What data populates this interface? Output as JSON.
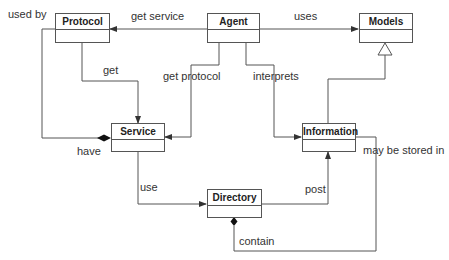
{
  "diagram": {
    "type": "UML class diagram",
    "classes": [
      {
        "id": "protocol",
        "name": "Protocol"
      },
      {
        "id": "agent",
        "name": "Agent"
      },
      {
        "id": "models",
        "name": "Models"
      },
      {
        "id": "service",
        "name": "Service"
      },
      {
        "id": "information",
        "name": "Information"
      },
      {
        "id": "directory",
        "name": "Directory"
      }
    ],
    "relations": [
      {
        "id": "get_service",
        "label": "get service",
        "from": "Agent",
        "to": "Protocol",
        "kind": "association-arrow"
      },
      {
        "id": "uses",
        "label": "uses",
        "from": "Agent",
        "to": "Models",
        "kind": "association-arrow"
      },
      {
        "id": "used_by",
        "label": "used by",
        "from": "Protocol",
        "to": "Service",
        "kind": "composition"
      },
      {
        "id": "get",
        "label": "get",
        "from": "Protocol",
        "to": "Service",
        "kind": "association-arrow"
      },
      {
        "id": "get_protocol",
        "label": "get protocol",
        "from": "Agent",
        "to": "Service",
        "kind": "association-arrow"
      },
      {
        "id": "interprets",
        "label": "interprets",
        "from": "Agent",
        "to": "Information",
        "kind": "association-arrow"
      },
      {
        "id": "inherits",
        "label": "",
        "from": "Information",
        "to": "Models",
        "kind": "generalization"
      },
      {
        "id": "have",
        "label": "have",
        "from": "Service",
        "to": "Protocol",
        "kind": "composition"
      },
      {
        "id": "use",
        "label": "use",
        "from": "Service",
        "to": "Directory",
        "kind": "association-arrow"
      },
      {
        "id": "post",
        "label": "post",
        "from": "Directory",
        "to": "Information",
        "kind": "association-arrow"
      },
      {
        "id": "may_be_stored_in",
        "label": "may be stored in",
        "from": "Information",
        "to": "Directory",
        "kind": "composition"
      },
      {
        "id": "contain",
        "label": "contain",
        "from": "Information",
        "to": "Directory",
        "kind": "composition"
      }
    ]
  },
  "colors": {
    "line": "#555555",
    "text": "#222222",
    "background": "#ffffff"
  }
}
